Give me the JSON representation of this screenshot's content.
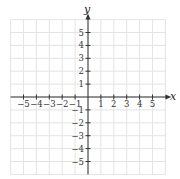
{
  "chart_data": {
    "type": "scatter",
    "title": "",
    "xlabel": "x",
    "ylabel": "y",
    "xlim": [
      -6,
      6
    ],
    "ylim": [
      -6,
      6
    ],
    "grid": true,
    "x_ticks": [
      -5,
      -4,
      -3,
      -2,
      -1,
      1,
      2,
      3,
      4,
      5
    ],
    "y_ticks": [
      -5,
      -4,
      -3,
      -2,
      -1,
      1,
      2,
      3,
      4,
      5
    ],
    "x_tick_labels": [
      "−5",
      "−4",
      "−3",
      "−2",
      "−1",
      "1",
      "2",
      "3",
      "4",
      "5"
    ],
    "y_tick_labels": [
      "−5",
      "−4",
      "−3",
      "−2",
      "−1",
      "1",
      "2",
      "3",
      "4",
      "5"
    ],
    "series": []
  },
  "colors": {
    "grid": "#e4e4e4",
    "axis": "#333333"
  },
  "axes": {
    "x_label": "x",
    "y_label": "y"
  }
}
